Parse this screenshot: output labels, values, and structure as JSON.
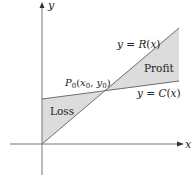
{
  "diagram": {
    "axes": {
      "x_label": "x",
      "y_label": "y"
    },
    "curves": {
      "revenue": {
        "label": "y = R(x)",
        "eq_lhs": "y = ",
        "func": "R",
        "arg": "(x)"
      },
      "cost": {
        "label": "y = C(x)",
        "eq_lhs": "y = ",
        "func": "C",
        "arg": "(x)"
      }
    },
    "regions": {
      "loss": "Loss",
      "profit": "Profit"
    },
    "point": {
      "label": "P0(x0, y0)",
      "name": "P",
      "sub": "0",
      "open": "(",
      "x": "x",
      "x_sub": "0",
      "comma": ", ",
      "y": "y",
      "y_sub": "0",
      "close": ")"
    },
    "colors": {
      "shade": "#dcdcdc",
      "line": "#6e6e6e",
      "axis": "#777777",
      "text": "#222222"
    }
  }
}
